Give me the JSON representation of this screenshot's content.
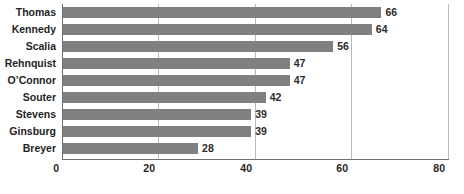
{
  "chart_data": {
    "type": "bar",
    "orientation": "horizontal",
    "title": "",
    "subtitle": "",
    "xlabel": "",
    "ylabel": "",
    "categories": [
      "Thomas",
      "Kennedy",
      "Scalia",
      "Rehnquist",
      "O’Connor",
      "Souter",
      "Stevens",
      "Ginsburg",
      "Breyer"
    ],
    "values": [
      66,
      64,
      56,
      47,
      47,
      42,
      39,
      39,
      28
    ],
    "value_labels": [
      "66",
      "64",
      "56",
      "47",
      "47",
      "42",
      "39",
      "39",
      "28"
    ],
    "xlim": [
      0,
      80
    ],
    "xticks": [
      0,
      20,
      40,
      60,
      80
    ],
    "xtick_labels": [
      "0",
      "20",
      "40",
      "60",
      "80"
    ],
    "grid": true,
    "grid_axis": "x",
    "legend": false,
    "series": [
      {
        "name": "",
        "values": [
          66,
          64,
          56,
          47,
          47,
          42,
          39,
          39,
          28
        ],
        "color": "#808080"
      }
    ],
    "colors": {
      "bar": "#808080",
      "gridline": "#b9b9b9",
      "axis": "#6f6f6f",
      "background": "#ffffff",
      "label_text": "#1f1f1f",
      "value_text": "#2b2b2b"
    }
  }
}
